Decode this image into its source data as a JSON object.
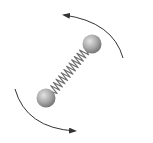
{
  "diagram": {
    "subject": "rotating diatomic molecule",
    "atoms": [
      {
        "name": "atom-top-right",
        "cx": 92,
        "cy": 44,
        "r": 9.5
      },
      {
        "name": "atom-bottom-left",
        "cx": 46,
        "cy": 98,
        "r": 9.5
      }
    ],
    "bond": {
      "type": "spring",
      "coils": 13
    },
    "arrows": [
      {
        "name": "rotation-arrow-upper",
        "direction": "counterclockwise",
        "path": "M123,58 Q113,22 64,15"
      },
      {
        "name": "rotation-arrow-lower",
        "direction": "counterclockwise",
        "path": "M15,89 Q26,128 75,131"
      }
    ],
    "colors": {
      "atom_light": "#d0d0d0",
      "atom_dark": "#7a7a7a",
      "spring": "#6e6e6e",
      "arrow": "#333333",
      "background": "#ffffff"
    }
  }
}
